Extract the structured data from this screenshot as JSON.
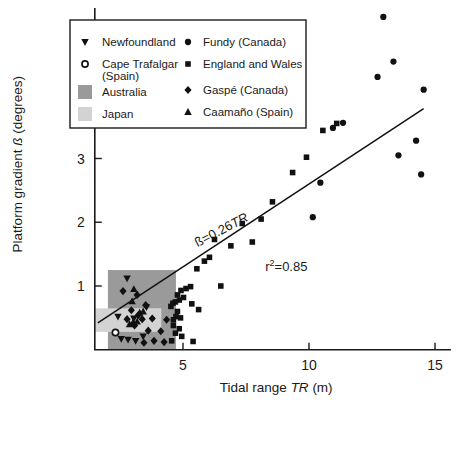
{
  "chart_data": {
    "type": "scatter",
    "title": "",
    "xlabel": "Tidal range TR (m)",
    "ylabel": "Platform gradient ß (degrees)",
    "xlabel_parts": {
      "pre": "Tidal range ",
      "italic": "TR",
      "post": " (m)"
    },
    "ylabel_parts": {
      "pre": "Platform gradient ",
      "italic": "ß",
      "post": " (degrees)"
    },
    "xlim": [
      1.5,
      15.6
    ],
    "ylim": [
      0,
      5.35
    ],
    "xticks": [
      5,
      10,
      15
    ],
    "xtick_labels": [
      "5",
      "10",
      "15"
    ],
    "yticks": [
      1,
      2,
      3,
      4,
      5
    ],
    "ytick_labels": [
      "1",
      "2",
      "3",
      "4",
      "5"
    ],
    "grid": false,
    "legend_position": "top-left-inside",
    "annotations": [
      {
        "name": "regression-equation",
        "text": "ß=0.26TR",
        "text_pre": "ß=0.26",
        "text_italic": "TR",
        "x": 6.6,
        "y": 1.82,
        "rotation": -27.5
      },
      {
        "name": "r-squared",
        "text": "r2=0.85",
        "text_pre": "r",
        "text_sup": "2",
        "text_post": "=0.85",
        "x": 9.1,
        "y": 1.23
      }
    ],
    "fit_line": {
      "label": "ß=0.26TR",
      "slope": 0.26,
      "intercept": 0,
      "r_squared": 0.85,
      "x_start": 1.62,
      "x_end": 14.55,
      "color": "#111111"
    },
    "shaded_regions": [
      {
        "name": "Australia",
        "color": "#9a9a9a",
        "x0": 2.02,
        "x1": 4.72,
        "y0": 0.0,
        "y1": 1.25
      },
      {
        "name": "Japan",
        "color": "#d3d3d3",
        "x0": 1.52,
        "x1": 4.14,
        "y0": 0.28,
        "y1": 0.65
      }
    ],
    "series": [
      {
        "name": "Newfoundland",
        "marker": "triangle-down",
        "color": "#111111",
        "points": [
          [
            2.78,
            1.12
          ],
          [
            2.42,
            0.52
          ],
          [
            3.05,
            0.49
          ],
          [
            3.42,
            0.21
          ],
          [
            2.82,
            0.16
          ],
          [
            3.12,
            0.14
          ],
          [
            2.55,
            0.17
          ],
          [
            3.55,
            0.67
          ]
        ]
      },
      {
        "name": "Cape Trafalgar (Spain)",
        "marker": "circle-open",
        "color": "#111111",
        "points": [
          [
            2.32,
            0.27
          ]
        ]
      },
      {
        "name": "Fundy (Canada)",
        "marker": "circle",
        "color": "#111111",
        "points": [
          [
            12.95,
            5.22
          ],
          [
            13.35,
            4.52
          ],
          [
            12.72,
            4.28
          ],
          [
            14.55,
            4.08
          ],
          [
            14.25,
            3.28
          ],
          [
            13.55,
            3.05
          ],
          [
            14.45,
            2.75
          ],
          [
            11.35,
            3.56
          ],
          [
            10.95,
            3.48
          ],
          [
            10.45,
            2.62
          ],
          [
            10.15,
            2.08
          ]
        ]
      },
      {
        "name": "England and Wales",
        "marker": "square",
        "color": "#111111",
        "points": [
          [
            11.1,
            3.55
          ],
          [
            10.55,
            3.44
          ],
          [
            9.9,
            3.02
          ],
          [
            9.35,
            2.78
          ],
          [
            8.55,
            2.32
          ],
          [
            8.1,
            2.05
          ],
          [
            7.35,
            1.98
          ],
          [
            7.75,
            1.69
          ],
          [
            6.9,
            1.63
          ],
          [
            6.25,
            1.73
          ],
          [
            6.05,
            1.45
          ],
          [
            5.85,
            1.39
          ],
          [
            5.55,
            1.27
          ],
          [
            6.5,
            1.0
          ],
          [
            5.3,
            0.99
          ],
          [
            5.12,
            0.96
          ],
          [
            4.92,
            0.93
          ],
          [
            4.78,
            0.86
          ],
          [
            5.02,
            0.82
          ],
          [
            4.85,
            0.78
          ],
          [
            4.7,
            0.75
          ],
          [
            4.6,
            0.73
          ],
          [
            5.35,
            0.72
          ],
          [
            4.52,
            0.68
          ],
          [
            5.62,
            0.63
          ],
          [
            4.78,
            0.6
          ],
          [
            4.72,
            0.52
          ],
          [
            4.9,
            0.5
          ],
          [
            4.62,
            0.47
          ],
          [
            4.62,
            0.38
          ],
          [
            4.85,
            0.33
          ],
          [
            4.7,
            0.26
          ],
          [
            4.95,
            0.21
          ],
          [
            5.4,
            0.13
          ],
          [
            4.55,
            0.14
          ]
        ]
      },
      {
        "name": "Gaspé (Canada)",
        "marker": "diamond",
        "color": "#111111",
        "points": [
          [
            2.62,
            0.92
          ],
          [
            3.18,
            0.86
          ],
          [
            2.95,
            0.62
          ],
          [
            3.52,
            0.7
          ],
          [
            3.22,
            0.54
          ],
          [
            2.78,
            0.48
          ],
          [
            3.38,
            0.48
          ],
          [
            3.78,
            0.49
          ],
          [
            4.35,
            0.47
          ],
          [
            3.08,
            0.38
          ],
          [
            3.62,
            0.3
          ],
          [
            4.12,
            0.29
          ],
          [
            3.85,
            0.14
          ],
          [
            4.25,
            0.12
          ],
          [
            3.45,
            0.11
          ]
        ]
      },
      {
        "name": "Caamaño (Spain)",
        "marker": "triangle-up",
        "color": "#111111",
        "points": [
          [
            3.05,
            0.95
          ],
          [
            2.98,
            0.76
          ],
          [
            3.28,
            0.58
          ],
          [
            3.42,
            0.6
          ],
          [
            3.02,
            0.43
          ],
          [
            3.18,
            0.44
          ],
          [
            2.88,
            0.4
          ]
        ]
      }
    ]
  },
  "legend": {
    "column_left": [
      {
        "label": "Newfoundland",
        "marker": "triangle-down"
      },
      {
        "label": "Cape Trafalgar (Spain)",
        "marker": "circle-open",
        "line1": "Cape Trafalgar",
        "line2": "(Spain)"
      },
      {
        "label": "Australia",
        "marker": "swatch",
        "color": "#9a9a9a"
      },
      {
        "label": "Japan",
        "marker": "swatch",
        "color": "#d3d3d3"
      }
    ],
    "column_right": [
      {
        "label": "Fundy (Canada)",
        "marker": "circle"
      },
      {
        "label": "England and Wales",
        "marker": "square"
      },
      {
        "label": "Gaspé (Canada)",
        "marker": "diamond"
      },
      {
        "label": "Caamaño (Spain)",
        "marker": "triangle-up"
      }
    ]
  }
}
